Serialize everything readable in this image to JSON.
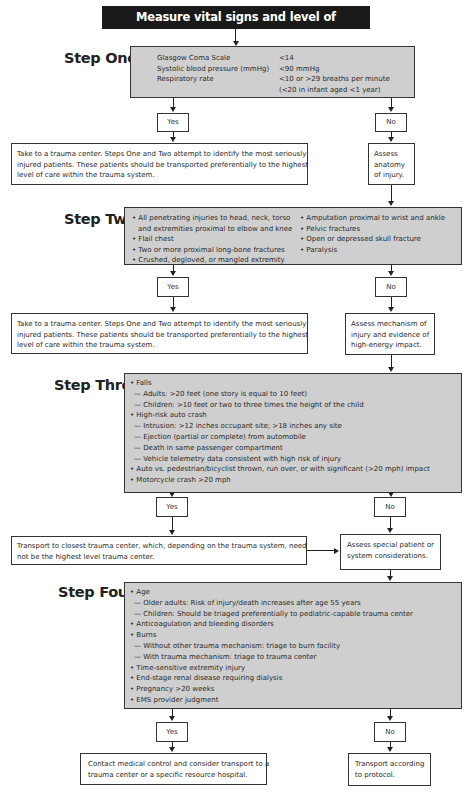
{
  "header": {
    "title": "Measure vital signs and level of consciousness"
  },
  "steps": [
    {
      "label": "Step One",
      "criteria": [
        {
          "name": "Glasgow Coma Scale",
          "value": "<14"
        },
        {
          "name": "Systolic blood pressure (mmHg)",
          "value": "<90 mmHg"
        },
        {
          "name": "Respiratory rate",
          "value": "<10 or >29 breaths per minute"
        },
        {
          "name": "",
          "value": "(<20 in infant aged <1 year)"
        }
      ],
      "yes": "Yes",
      "no": "No",
      "yes_action": "Take to a trauma center.  Steps One and Two attempt to identify the most seriously injured patients. These patients should be transported preferentially to the highest level of care within the trauma system.",
      "yes_action_lines": [
        "Take to a trauma center.  Steps One and Two attempt to identify the most seriously",
        "injured patients. These patients should be transported preferentially to the highest",
        "level of care within the trauma system."
      ],
      "no_action_lines": [
        "Assess",
        "anatomy",
        "of injury."
      ]
    },
    {
      "label": "Step Two",
      "left_items": [
        "• All penetrating injuries to head, neck, torso",
        "   and extremities proximal to elbow and knee",
        "• Flail chest",
        "• Two or more proximal long-bone fractures",
        "• Crushed, degloved, or mangled extremity"
      ],
      "right_items": [
        "• Amputation proximal to wrist and ankle",
        "• Pelvic fractures",
        "• Open or depressed skull fracture",
        "• Paralysis"
      ],
      "yes": "Yes",
      "no": "No",
      "yes_action_lines": [
        "Take to a trauma center. Steps One and Two attempt to identify the most seriously",
        "injured patients. These patients should be transported preferentially to the highest",
        "level of care within the trauma system."
      ],
      "no_action_lines": [
        "Assess mechanism of",
        "injury and evidence of",
        "high-energy impact."
      ]
    },
    {
      "label": "Step Three",
      "items": [
        {
          "level": 1,
          "text": "• Falls"
        },
        {
          "level": 2,
          "text": "— Adults: >20 feet (one story is equal to 10 feet)"
        },
        {
          "level": 2,
          "text": "— Children: >10 feet or two to three times the height of the child"
        },
        {
          "level": 1,
          "text": "• High-risk auto crash"
        },
        {
          "level": 2,
          "text": "— Intrusion: >12 inches occupant site; >18 inches any site"
        },
        {
          "level": 2,
          "text": "— Ejection (partial or complete) from automobile"
        },
        {
          "level": 2,
          "text": "— Death in same passenger compartment"
        },
        {
          "level": 2,
          "text": "— Vehicle telemetry data consistent with high risk of injury"
        },
        {
          "level": 1,
          "text": "• Auto vs. pedestrian/bicyclist thrown, run over, or with significant (>20 mph) impact"
        },
        {
          "level": 1,
          "text": "• Motorcycle crash >20 mph"
        }
      ],
      "yes": "Yes",
      "no": "No",
      "yes_action_lines": [
        "Transport to closest trauma center, which, depending on the trauma system, need",
        "not be the highest level trauma center."
      ],
      "no_action_lines": [
        "Assess special patient or",
        "system considerations."
      ]
    },
    {
      "label": "Step Four",
      "items": [
        {
          "level": 1,
          "text": "• Age"
        },
        {
          "level": 2,
          "text": "— Older adults: Risk of injury/death increases after age 55 years"
        },
        {
          "level": 2,
          "text": "— Children: Should be triaged preferentially to pediatric-capable trauma center"
        },
        {
          "level": 1,
          "text": "• Anticoagulation and bleeding disorders"
        },
        {
          "level": 1,
          "text": "• Burns"
        },
        {
          "level": 2,
          "text": "— Without other trauma mechanism: triage to burn facility"
        },
        {
          "level": 2,
          "text": "— With trauma mechanism: triage to trauma center"
        },
        {
          "level": 1,
          "text": "• Time-sensitive extremity injury"
        },
        {
          "level": 1,
          "text": "• End-stage renal disease requiring dialysis"
        },
        {
          "level": 1,
          "text": "• Pregnancy >20 weeks"
        },
        {
          "level": 1,
          "text": "• EMS  provider judgment"
        }
      ],
      "yes": "Yes",
      "no": "No",
      "yes_action_lines": [
        "Contact medical control and consider transport to a",
        "trauma center or a specific resource hospital."
      ],
      "no_action_lines": [
        "Transport according",
        "to protocol."
      ]
    }
  ],
  "colors": {
    "criteria_box": "#cfcfcf",
    "header_bg": "#1a1a1a",
    "header_text": "#ffffff",
    "lines": "#222222"
  }
}
